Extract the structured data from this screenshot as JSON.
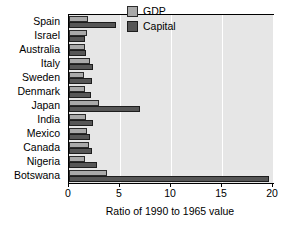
{
  "chart_data": {
    "type": "bar",
    "orientation": "horizontal",
    "title": "",
    "xlabel": "Ratio of 1990 to 1965 value",
    "ylabel": "",
    "xlim": [
      0,
      20
    ],
    "xticks": [
      0,
      5,
      10,
      15,
      20
    ],
    "xticklabels": [
      "0",
      "5",
      "10",
      "15",
      "20"
    ],
    "grid": "vertical",
    "legend_position": "upper right",
    "categories": [
      "Spain",
      "Israel",
      "Australia",
      "Italy",
      "Sweden",
      "Denmark",
      "Japan",
      "India",
      "Mexico",
      "Canada",
      "Nigeria",
      "Botswana"
    ],
    "series": [
      {
        "name": "GDP",
        "color": "#a9a9a9",
        "values": [
          1.9,
          1.8,
          1.6,
          2.1,
          1.5,
          1.6,
          2.9,
          1.7,
          1.8,
          2.0,
          1.6,
          3.7
        ]
      },
      {
        "name": "Capital",
        "color": "#565656",
        "values": [
          4.6,
          1.6,
          1.7,
          2.4,
          2.3,
          2.2,
          7.0,
          2.4,
          2.1,
          2.3,
          2.7,
          19.6
        ]
      }
    ]
  },
  "legend": {
    "items": [
      {
        "label": "GDP",
        "color": "#a9a9a9"
      },
      {
        "label": "Capital",
        "color": "#565656"
      }
    ]
  }
}
